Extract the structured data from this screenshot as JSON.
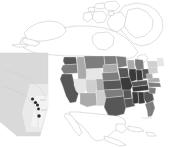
{
  "figure": {
    "kind": "choropleth-map",
    "title": "",
    "projection_extent": "North America",
    "background_color": "#ffffff",
    "border_color": "#b8b8b8",
    "region_outline_color": "#e8e8e8",
    "point_color": "#2a2a2a"
  },
  "legend": {
    "visible": false,
    "classes": [
      {
        "label": "no data",
        "color": "#ffffff"
      },
      {
        "label": "very low",
        "color": "#e6e6e6"
      },
      {
        "label": "low",
        "color": "#cfcfcf"
      },
      {
        "label": "medium",
        "color": "#aaaaaa"
      },
      {
        "label": "high",
        "color": "#7d7d7d"
      },
      {
        "label": "very high",
        "color": "#575757"
      },
      {
        "label": "highest",
        "color": "#3a3a3a"
      }
    ]
  },
  "inset": {
    "name": "alberta-inset",
    "label": "",
    "fill": "#d9d9d9",
    "point_count": 5,
    "points": [
      {
        "name": "site-1",
        "x": 32.5,
        "y": 99.0
      },
      {
        "name": "site-2",
        "x": 35.5,
        "y": 102.5
      },
      {
        "name": "site-3",
        "x": 37.5,
        "y": 105.0
      },
      {
        "name": "site-4",
        "x": 38.5,
        "y": 109.0
      },
      {
        "name": "site-5",
        "x": 39.0,
        "y": 116.0
      }
    ]
  },
  "chart_data": {
    "type": "heatmap",
    "title": "",
    "xlabel": "",
    "ylabel": "",
    "categories": [
      "Washington",
      "Oregon",
      "California",
      "Idaho",
      "Nevada",
      "Utah",
      "Arizona",
      "Montana",
      "Wyoming",
      "Colorado",
      "New Mexico",
      "North Dakota",
      "South Dakota",
      "Nebraska",
      "Kansas",
      "Oklahoma",
      "Texas",
      "Minnesota",
      "Iowa",
      "Missouri",
      "Arkansas",
      "Louisiana",
      "Wisconsin",
      "Illinois",
      "Michigan",
      "Indiana",
      "Ohio",
      "Kentucky",
      "Tennessee",
      "Mississippi",
      "Alabama",
      "Georgia",
      "Florida",
      "South Carolina",
      "North Carolina",
      "Virginia",
      "West Virginia",
      "Pennsylvania",
      "New York",
      "Maine",
      "Alaska",
      "Canada",
      "Mexico",
      "Greenland"
    ],
    "values": [
      5,
      4,
      5,
      3,
      1,
      2,
      3,
      4,
      1,
      3,
      2,
      4,
      3,
      4,
      5,
      4,
      5,
      4,
      5,
      6,
      5,
      5,
      3,
      6,
      4,
      6,
      5,
      5,
      6,
      6,
      6,
      5,
      4,
      4,
      4,
      3,
      3,
      2,
      2,
      1,
      0,
      0,
      0,
      0
    ],
    "value_scale": [
      0,
      6
    ],
    "colors": [
      "#ffffff",
      "#e6e6e6",
      "#cfcfcf",
      "#aaaaaa",
      "#7d7d7d",
      "#575757",
      "#3a3a3a"
    ],
    "grid": false,
    "legend_position": "none"
  }
}
